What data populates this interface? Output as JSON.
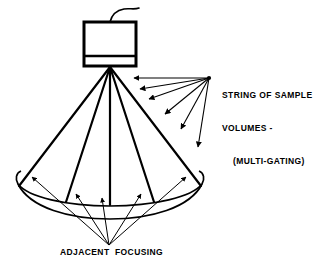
{
  "figure": {
    "type": "technical-line-diagram",
    "background_color": "#ffffff",
    "line_color": "#000000"
  },
  "labels": {
    "sample_volumes": {
      "line1": "STRING OF SAMPLE",
      "line2": "VOLUMES -",
      "line3": "(MULTI-GATING)"
    },
    "adjacent_focusing": "ADJACENT  FOCUSING"
  },
  "components": {
    "transducer": {
      "name": "transducer-housing",
      "cable": "wavy-cable"
    },
    "beam": {
      "name": "beam-cone",
      "ray_count": 5,
      "base": "elliptical-cone-base"
    },
    "gating_arrows": {
      "name": "multi-gating-arrow-fan",
      "count": 6,
      "origin": "209,78"
    },
    "focusing_arrows": {
      "name": "adjacent-focusing-arrow-fan",
      "count": 5,
      "origin": "109,245"
    }
  }
}
